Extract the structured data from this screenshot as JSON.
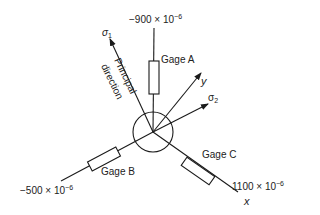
{
  "diagram": {
    "gage_a": {
      "label": "Gage A",
      "strain_value": "−900 × 10",
      "exponent": "−6"
    },
    "gage_b": {
      "label": "Gage B",
      "strain_value": "−500 × 10",
      "exponent": "−6"
    },
    "gage_c": {
      "label": "Gage C",
      "strain_value": "1100 × 10",
      "exponent": "−6"
    },
    "axis_x": "x",
    "axis_y": "y",
    "sigma1": {
      "symbol": "σ",
      "sub": "1"
    },
    "sigma2": {
      "symbol": "σ",
      "sub": "2"
    },
    "principal_direction": {
      "line1": "Principal",
      "line2": "direction"
    },
    "colors": {
      "stroke": "#1a1a1a",
      "text": "#222222",
      "background": "#ffffff"
    }
  }
}
